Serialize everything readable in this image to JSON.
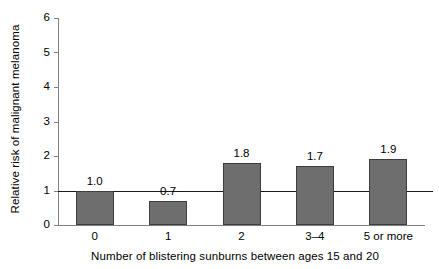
{
  "chart_data": {
    "type": "bar",
    "title": "",
    "subtitle": "",
    "xlabel": "Number of blistering sunburns between ages 15 and 20",
    "ylabel": "Relative risk of malignant melanoma",
    "categories": [
      "0",
      "1",
      "2",
      "3–4",
      "5 or more"
    ],
    "values": [
      1.0,
      0.7,
      1.8,
      1.7,
      1.9
    ],
    "data_labels": [
      "1.0",
      "0.7",
      "1.8",
      "1.7",
      "1.9"
    ],
    "ylim": [
      0,
      6
    ],
    "yticks": [
      0,
      1,
      2,
      3,
      4,
      5,
      6
    ],
    "ytick_labels": [
      "0",
      "1",
      "2",
      "3",
      "4",
      "5",
      "6"
    ],
    "grid": false,
    "legend": null,
    "legend_position": "none",
    "annotations": [
      {
        "name": "reference-line",
        "type": "hline",
        "value": 1,
        "label": ""
      }
    ],
    "colors": {
      "bar_fill": "#6e6e6e",
      "bar_stroke": "#3d3d3d",
      "axis": "#808080",
      "reference_line": "#1a1a1a",
      "text": "#000000",
      "background": "#ffffff"
    }
  }
}
